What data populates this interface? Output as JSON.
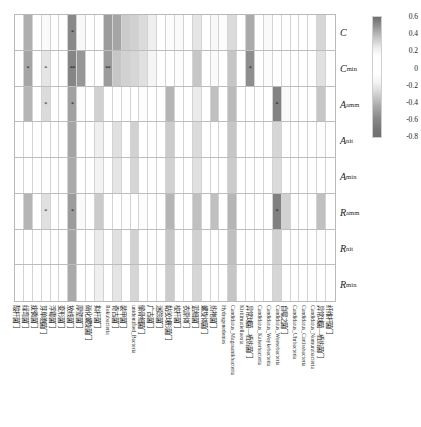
{
  "figure": {
    "type": "heatmap",
    "title": "",
    "xlabel": "",
    "ylabel": ""
  },
  "colorbar": {
    "name": "correlation-colorbar",
    "ticks": [
      "0.6",
      "0.4",
      "0.2",
      "0",
      "-0.2",
      "-0.4",
      "-0.6",
      "-0.8"
    ],
    "vmax": 0.6,
    "vmin": -0.8,
    "colormap": "grayscale-diverging"
  },
  "rows": [
    {
      "label": "C",
      "sub": ""
    },
    {
      "label": "C",
      "sub": "min"
    },
    {
      "label": "A",
      "sub": "amm"
    },
    {
      "label": "A",
      "sub": "nit"
    },
    {
      "label": "A",
      "sub": "min"
    },
    {
      "label": "R",
      "sub": "amm"
    },
    {
      "label": "R",
      "sub": "nit"
    },
    {
      "label": "R",
      "sub": "min"
    }
  ],
  "columns": [
    {
      "label": "酸杆菌门",
      "cjk": true
    },
    {
      "label": "绿弯菌门",
      "cjk": true
    },
    {
      "label": "疣微菌门",
      "cjk": true
    },
    {
      "label": "芽单胞菌门",
      "cjk": true
    },
    {
      "label": "浮霉菌门",
      "cjk": true
    },
    {
      "label": "变形菌门",
      "cjk": true
    },
    {
      "label": "放线菌门",
      "cjk": true
    },
    {
      "label": "厚壁菌门",
      "cjk": true
    },
    {
      "label": "硝化螺旋菌门",
      "cjk": true
    },
    {
      "label": "拟杆菌门",
      "cjk": true
    },
    {
      "label": "Rokubacteria",
      "cjk": false
    },
    {
      "label": "奇古菌门",
      "cjk": true
    },
    {
      "label": "装甲菌门",
      "cjk": true
    },
    {
      "label": "unidentified_Bacteria",
      "cjk": false
    },
    {
      "label": "髌骨细菌门",
      "cjk": true
    },
    {
      "label": "广古菌门",
      "cjk": true
    },
    {
      "label": "迷踪菌门",
      "cjk": true
    },
    {
      "label": "黏胶球形菌门",
      "cjk": true
    },
    {
      "label": "梭杆菌门",
      "cjk": true
    },
    {
      "label": "衣原体门",
      "cjk": true
    },
    {
      "label": "蓝细菌门",
      "cjk": true
    },
    {
      "label": "螺旋体菌门",
      "cjk": true
    },
    {
      "label": "热袍菌门",
      "cjk": true
    },
    {
      "label": "Hydrogenedentes",
      "cjk": false
    },
    {
      "label": "Candidatus_Magasanikbacteria",
      "cjk": false
    },
    {
      "label": "Kiritimatiellaeota",
      "cjk": false
    },
    {
      "label": "异常球菌—栖热菌门",
      "cjk": true
    },
    {
      "label": "Candidatus_Kaiserbacteria",
      "cjk": false
    },
    {
      "label": "Candidatus_Woykebacteria",
      "cjk": false
    },
    {
      "label": "Candidatus_Woesebacteria",
      "cjk": false
    },
    {
      "label": "自噬之菌门",
      "cjk": true
    },
    {
      "label": "Candidatus_Uhrbacteria",
      "cjk": false
    },
    {
      "label": "Candidatus_Curtissbacteria",
      "cjk": false
    },
    {
      "label": "Candidatus_Nomurabacteria",
      "cjk": false
    },
    {
      "label": "异常球菌—栖热菌门",
      "cjk": true
    },
    {
      "label": "纤维杆菌门",
      "cjk": true
    }
  ],
  "chart_data": {
    "type": "heatmap",
    "title": "",
    "xlabel": "",
    "ylabel": "",
    "legend_position": "right",
    "grid": true,
    "zlim": [
      -0.8,
      0.6
    ],
    "row_labels": [
      "C",
      "Cmin",
      "Aamm",
      "Anit",
      "Amin",
      "Ramm",
      "Rnit",
      "Rmin"
    ],
    "col_labels": [
      "酸杆菌门",
      "绿弯菌门",
      "疣微菌门",
      "芽单胞菌门",
      "浮霉菌门",
      "变形菌门",
      "放线菌门",
      "厚壁菌门",
      "硝化螺旋菌门",
      "拟杆菌门",
      "Rokubacteria",
      "奇古菌门",
      "装甲菌门",
      "unidentified_Bacteria",
      "髌骨细菌门",
      "广古菌门",
      "迷踪菌门",
      "黏胶球形菌门",
      "梭杆菌门",
      "衣原体门",
      "蓝细菌门",
      "螺旋体菌门",
      "热袍菌门",
      "Hydrogenedentes",
      "Candidatus_Magasanikbacteria",
      "Kiritimatiellaeota",
      "异常球菌—栖热菌门",
      "Candidatus_Kaiserbacteria",
      "Candidatus_Woykebacteria",
      "Candidatus_Woesebacteria",
      "自噬之菌门",
      "Candidatus_Uhrbacteria",
      "Candidatus_Curtissbacteria",
      "Candidatus_Nomurabacteria",
      "异常球菌—栖热菌门",
      "纤维杆菌门"
    ],
    "values": [
      [
        0.05,
        -0.42,
        0.02,
        -0.1,
        0.06,
        -0.02,
        -0.58,
        -0.12,
        0.04,
        -0.04,
        -0.5,
        -0.46,
        -0.32,
        -0.3,
        -0.26,
        -0.18,
        0.02,
        -0.08,
        -0.1,
        -0.06,
        -0.22,
        0.04,
        -0.12,
        -0.08,
        -0.26,
        0.02,
        -0.44,
        -0.06,
        -0.1,
        0.02,
        -0.04,
        -0.06,
        0.04,
        -0.06,
        -0.28,
        0.02
      ],
      [
        0.04,
        -0.46,
        0.02,
        -0.22,
        0.04,
        -0.02,
        -0.6,
        -0.52,
        0.06,
        -0.06,
        -0.5,
        -0.34,
        -0.3,
        -0.28,
        -0.24,
        -0.14,
        0.04,
        -0.04,
        -0.08,
        -0.04,
        -0.34,
        0.02,
        -0.1,
        -0.06,
        -0.34,
        0.04,
        -0.56,
        -0.04,
        -0.08,
        0.04,
        -0.06,
        -0.04,
        0.02,
        -0.04,
        -0.24,
        0.04
      ],
      [
        0.02,
        -0.4,
        0.04,
        -0.26,
        0.02,
        -0.04,
        -0.48,
        -0.08,
        0.02,
        -0.3,
        -0.06,
        -0.04,
        -0.02,
        -0.06,
        -0.08,
        -0.04,
        0.02,
        -0.4,
        -0.04,
        -0.06,
        -0.2,
        -0.02,
        -0.36,
        -0.06,
        -0.38,
        -0.02,
        -0.06,
        -0.04,
        -0.02,
        -0.62,
        -0.1,
        -0.04,
        0.02,
        -0.04,
        -0.34,
        0.02
      ],
      [
        0.02,
        -0.04,
        0.02,
        -0.06,
        0.02,
        -0.02,
        -0.46,
        -0.06,
        0.02,
        -0.18,
        -0.04,
        -0.24,
        -0.02,
        -0.3,
        -0.04,
        -0.02,
        0.02,
        -0.32,
        -0.02,
        -0.04,
        -0.26,
        -0.02,
        -0.06,
        -0.04,
        -0.34,
        -0.02,
        -0.04,
        -0.02,
        -0.02,
        -0.28,
        -0.06,
        -0.02,
        0.02,
        -0.02,
        -0.08,
        0.02
      ],
      [
        0.02,
        -0.04,
        0.02,
        -0.06,
        0.02,
        -0.02,
        -0.44,
        -0.06,
        0.02,
        -0.16,
        -0.04,
        -0.22,
        -0.02,
        -0.28,
        -0.04,
        -0.02,
        0.02,
        -0.3,
        -0.02,
        -0.04,
        -0.24,
        -0.02,
        -0.06,
        -0.04,
        -0.32,
        -0.02,
        -0.04,
        -0.02,
        -0.02,
        -0.26,
        -0.06,
        -0.02,
        0.02,
        -0.02,
        -0.06,
        0.02
      ],
      [
        0.02,
        -0.4,
        0.02,
        -0.24,
        0.02,
        -0.04,
        -0.5,
        -0.1,
        0.02,
        -0.32,
        -0.06,
        -0.04,
        -0.02,
        -0.06,
        -0.08,
        -0.04,
        0.02,
        -0.4,
        -0.04,
        -0.06,
        -0.36,
        -0.02,
        -0.36,
        -0.06,
        -0.4,
        -0.02,
        -0.06,
        -0.04,
        -0.02,
        -0.64,
        -0.3,
        -0.04,
        0.02,
        -0.04,
        -0.36,
        0.02
      ],
      [
        0.02,
        -0.04,
        0.02,
        -0.06,
        0.02,
        -0.02,
        -0.46,
        -0.06,
        0.02,
        -0.2,
        -0.04,
        -0.24,
        -0.02,
        -0.3,
        -0.04,
        -0.02,
        0.02,
        -0.34,
        -0.02,
        -0.04,
        -0.3,
        -0.02,
        -0.06,
        -0.04,
        -0.36,
        -0.02,
        -0.04,
        -0.02,
        -0.02,
        -0.3,
        -0.06,
        -0.02,
        0.02,
        -0.02,
        -0.08,
        0.02
      ],
      [
        0.02,
        -0.04,
        0.02,
        -0.06,
        0.02,
        -0.02,
        -0.44,
        -0.06,
        0.02,
        -0.18,
        -0.04,
        -0.22,
        -0.02,
        -0.28,
        -0.04,
        -0.02,
        0.02,
        -0.32,
        -0.02,
        -0.04,
        -0.28,
        -0.02,
        -0.06,
        -0.04,
        -0.34,
        -0.02,
        -0.04,
        -0.02,
        -0.02,
        -0.28,
        -0.06,
        -0.02,
        0.02,
        -0.02,
        -0.06,
        0.02
      ]
    ],
    "significance": [
      [
        "",
        "",
        "",
        "",
        "",
        "",
        "*",
        "",
        "",
        "",
        "",
        "",
        "",
        "",
        "",
        "",
        "",
        "",
        "",
        "",
        "",
        "",
        "",
        "",
        "",
        "",
        "",
        "",
        "",
        "",
        "",
        "",
        "",
        "",
        "",
        ""
      ],
      [
        "",
        "*",
        "",
        "*",
        "",
        "",
        "**",
        "",
        "",
        "",
        "**",
        "",
        "",
        "",
        "",
        "",
        "",
        "",
        "",
        "",
        "",
        "",
        "",
        "",
        "",
        "",
        "*",
        "",
        "",
        "",
        "",
        "",
        "",
        "",
        "",
        ""
      ],
      [
        "",
        "",
        "",
        "*",
        "",
        "",
        "*",
        "",
        "",
        "",
        "",
        "",
        "",
        "",
        "",
        "",
        "",
        "",
        "",
        "",
        "",
        "",
        "",
        "",
        "",
        "",
        "",
        "",
        "",
        "*",
        "",
        "",
        "",
        "",
        "",
        ""
      ],
      [
        "",
        "",
        "",
        "",
        "",
        "",
        "",
        "",
        "",
        "",
        "",
        "",
        "",
        "",
        "",
        "",
        "",
        "",
        "",
        "",
        "",
        "",
        "",
        "",
        "",
        "",
        "",
        "",
        "",
        "",
        "",
        "",
        "",
        "",
        "",
        ""
      ],
      [
        "",
        "",
        "",
        "",
        "",
        "",
        "",
        "",
        "",
        "",
        "",
        "",
        "",
        "",
        "",
        "",
        "",
        "",
        "",
        "",
        "",
        "",
        "",
        "",
        "",
        "",
        "",
        "",
        "",
        "",
        "",
        "",
        "",
        "",
        "",
        ""
      ],
      [
        "",
        "",
        "",
        "*",
        "",
        "",
        "*",
        "",
        "",
        "",
        "",
        "",
        "",
        "",
        "",
        "",
        "",
        "",
        "",
        "",
        "",
        "",
        "",
        "",
        "",
        "",
        "",
        "",
        "",
        "*",
        "",
        "",
        "",
        "",
        "",
        ""
      ],
      [
        "",
        "",
        "",
        "",
        "",
        "",
        "",
        "",
        "",
        "",
        "",
        "",
        "",
        "",
        "",
        "",
        "",
        "",
        "",
        "",
        "",
        "",
        "",
        "",
        "",
        "",
        "",
        "",
        "",
        "",
        "",
        "",
        "",
        "",
        "",
        ""
      ],
      [
        "",
        "",
        "",
        "",
        "",
        "",
        "",
        "",
        "",
        "",
        "",
        "",
        "",
        "",
        "",
        "",
        "",
        "",
        "",
        "",
        "",
        "",
        "",
        "",
        "",
        "",
        "",
        "",
        "",
        "",
        "",
        "",
        "",
        "",
        "",
        ""
      ]
    ]
  }
}
